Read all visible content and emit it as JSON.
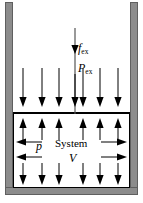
{
  "figure": {
    "colors": {
      "wall": "#8c8c8c",
      "wall_edge": "#5f5f5f",
      "stroke": "#000000",
      "background": "#ffffff"
    },
    "labels": {
      "force_external": {
        "base": "f",
        "sub": "ex"
      },
      "pressure_external": {
        "base": "P",
        "sub": "ex"
      },
      "pressure_internal": {
        "base": "p",
        "sub": ""
      },
      "system": "System",
      "volume": "V"
    },
    "arrows": {
      "force_shaft": {
        "name": "f-ex-force-arrow",
        "direction": "down"
      },
      "pressure_external_arrow": {
        "name": "p-ex-pressure-arrow",
        "direction": "down"
      },
      "surroundings_down": {
        "name": "external-pressure-arrows",
        "direction": "down",
        "count": 6,
        "x": [
          23,
          42,
          59,
          83,
          100,
          118
        ]
      },
      "system_up": {
        "name": "system-pressure-up-arrows",
        "direction": "up",
        "count": 6,
        "x": [
          23,
          42,
          59,
          83,
          100,
          118
        ]
      },
      "system_down": {
        "name": "system-pressure-down-arrows",
        "direction": "down",
        "count": 6,
        "x": [
          23,
          42,
          59,
          83,
          100,
          118
        ]
      },
      "system_left": {
        "name": "system-pressure-left-arrows",
        "direction": "left",
        "count": 2,
        "y": [
          143,
          157
        ]
      },
      "system_right": {
        "name": "system-pressure-right-arrows",
        "direction": "right",
        "count": 2,
        "y": [
          143,
          157
        ]
      }
    }
  }
}
